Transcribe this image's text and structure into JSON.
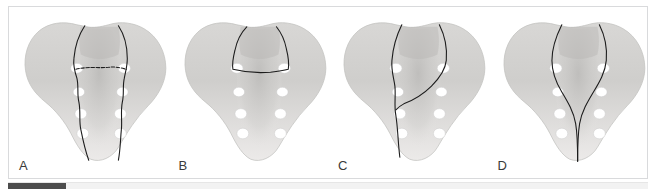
{
  "figure": {
    "caption_visible": false,
    "background_color": "#ffffff",
    "frame_border_color": "#d9dadc",
    "bone_fill_light": "#eceaea",
    "bone_fill_mid": "#d2d1cf",
    "bone_fill_dark": "#b6b5b3",
    "foramen_color": "#ffffff",
    "fracture_line_color": "#1c1c1c",
    "label_color": "#3a3a3a"
  },
  "panels": [
    {
      "label": "A",
      "name": "sacrum-panel-a",
      "fracture_pattern": "bilateral-vertical-through-foramina-with-transverse",
      "lines": [
        "M 92,24 C 88,38 84,48 83,60 C 82,72 81,84 81,96 C 81,110 83,126 86,140 C 88,148 90,154 92,158",
        "M 146,24 C 150,38 152,48 153,60 C 154,72 154,84 154,96 C 154,110 152,126 149,140 C 147,148 146,154 144,158",
        "M 83,62 L 153,62"
      ]
    },
    {
      "label": "B",
      "name": "sacrum-panel-b",
      "fracture_pattern": "transverse-upper-sacrum",
      "lines": [
        "M 92,26 C 88,36 86,46 85,56 C 84,60 84,62 85,64 L 150,64 C 152,62 153,58 153,54 C 152,44 150,34 147,26"
      ]
    },
    {
      "label": "C",
      "name": "sacrum-panel-c",
      "fracture_pattern": "oblique-left-vertical-right-transalar",
      "lines": [
        "M 90,22 C 87,36 84,48 83,60 C 82,72 81,86 81,100 C 81,116 82,136 84,158",
        "M 148,22 C 150,34 151,44 150,54 C 148,64 140,72 128,80 C 114,88 100,94 88,98"
      ]
    },
    {
      "label": "D",
      "name": "sacrum-panel-d",
      "fracture_pattern": "bilateral-vertical-converging-midline",
      "lines": [
        "M 90,22 C 86,36 84,48 84,60 C 84,74 88,86 96,96 C 104,106 110,118 112,132 C 113,144 113,152 113,160",
        "M 150,22 C 152,36 152,48 150,60 C 147,74 140,86 131,96 C 122,106 116,118 114,132 C 113,144 113,152 113,160"
      ]
    }
  ],
  "progress_bar": {
    "track_color": "#f2f2f2",
    "fill_color": "#4c4c4c",
    "fill_percent": 9
  }
}
